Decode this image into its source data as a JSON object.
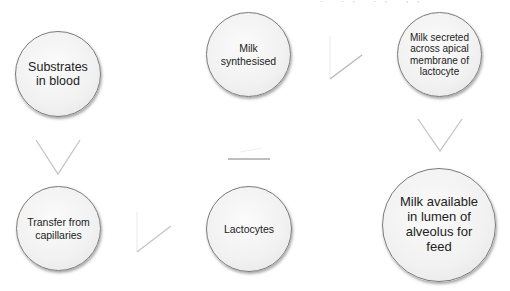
{
  "diagram": {
    "type": "flow",
    "top_fragment": "' . ' . , ' . , ' ,  ,",
    "nodes": [
      {
        "id": "substrates",
        "label": "Substrates\nin blood"
      },
      {
        "id": "transfer",
        "label": "Transfer from\ncapillaries"
      },
      {
        "id": "lactocytes",
        "label": "Lactocytes"
      },
      {
        "id": "synthesised",
        "label": "Milk\nsynthesised"
      },
      {
        "id": "secreted",
        "label": "Milk secreted\nacross apical\nmembrane of\nlactocyte"
      },
      {
        "id": "available",
        "label": "Milk available\nin  lumen of\nalveolus for\nfeed"
      }
    ],
    "edges": [
      {
        "from": "substrates",
        "to": "transfer",
        "direction": "down"
      },
      {
        "from": "transfer",
        "to": "lactocytes",
        "direction": "right"
      },
      {
        "from": "lactocytes",
        "to": "synthesised",
        "direction": "up"
      },
      {
        "from": "synthesised",
        "to": "secreted",
        "direction": "right"
      },
      {
        "from": "secreted",
        "to": "available",
        "direction": "down"
      }
    ],
    "colors": {
      "node_border": "#7a7a7a",
      "node_fill": "#f1f1f1",
      "arrow": "#bdbdbd",
      "text": "#222222"
    }
  }
}
